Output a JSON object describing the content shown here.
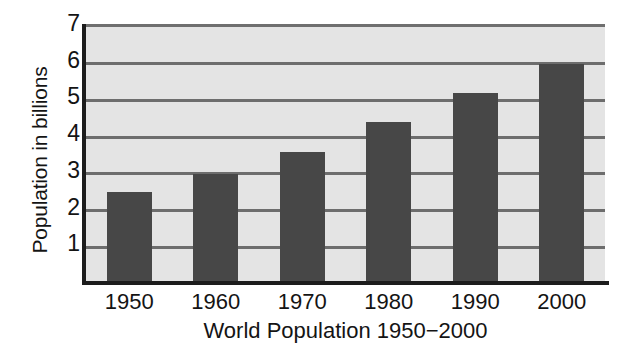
{
  "chart_data": {
    "type": "bar",
    "title": "",
    "xlabel": "World Population 1950−2000",
    "ylabel": "Population in billions",
    "categories": [
      "1950",
      "1960",
      "1970",
      "1980",
      "1990",
      "2000"
    ],
    "values": [
      2.5,
      3.0,
      3.6,
      4.4,
      5.2,
      6.0
    ],
    "ylim": [
      0,
      7
    ],
    "y_ticks": [
      "1",
      "2",
      "3",
      "4",
      "5",
      "6",
      "7"
    ],
    "y_tick_values": [
      1,
      2,
      3,
      4,
      5,
      6,
      7
    ],
    "grid": true,
    "legend": null,
    "colors": {
      "bar_fill": "#474747",
      "plot_background": "#e4e4e4",
      "gridline": "#6d6d6d",
      "axis_line": "#1c1c1c",
      "page_background": "#ffffff",
      "text": "#141414"
    }
  }
}
